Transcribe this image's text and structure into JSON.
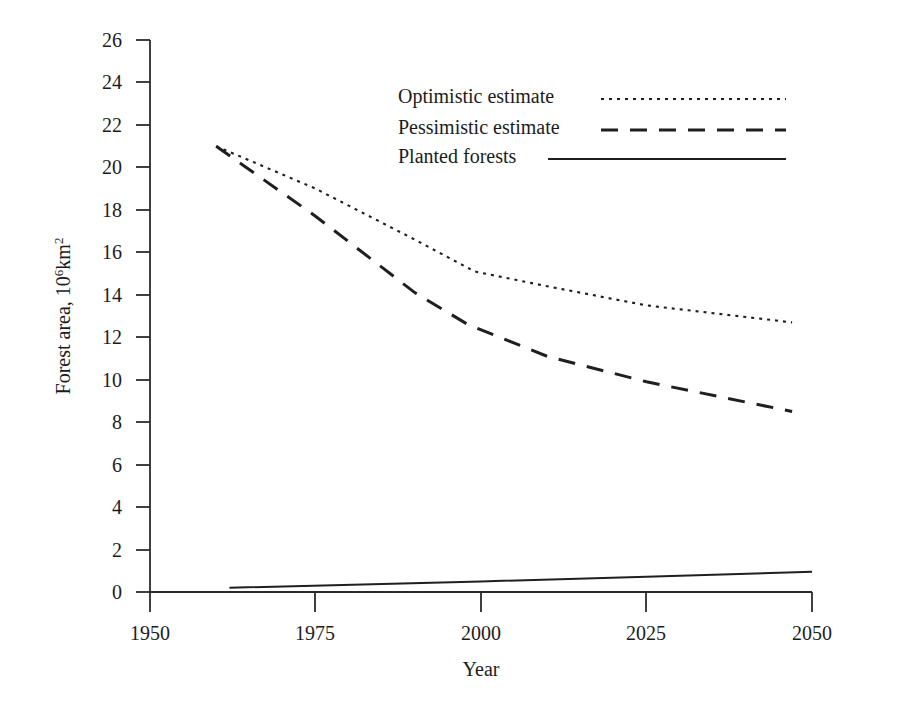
{
  "chart_data": {
    "type": "line",
    "title": "",
    "xlabel": "Year",
    "ylabel": "Forest area, 10⁶km²",
    "ylabel_base": "Forest area, 10",
    "ylabel_exp": "6",
    "ylabel_unit": "km",
    "ylabel_unit_exp": "2",
    "xlim": [
      1950,
      2050
    ],
    "ylim": [
      0,
      26
    ],
    "grid": false,
    "legend_position": "top-right",
    "x_ticks": [
      1950,
      1975,
      2000,
      2025,
      2050
    ],
    "x_tick_labels": [
      "1950",
      "1975",
      "2000",
      "2025",
      "2050"
    ],
    "y_ticks": [
      0,
      2,
      4,
      6,
      8,
      10,
      12,
      14,
      16,
      18,
      20,
      22,
      24,
      26
    ],
    "y_tick_labels": [
      "0",
      "2",
      "4",
      "6",
      "8",
      "10",
      "12",
      "14",
      "16",
      "18",
      "20",
      "22",
      "24",
      "26"
    ],
    "series": [
      {
        "name": "Optimistic estimate",
        "style": "dotted",
        "x": [
          1960,
          1975,
          1990,
          1999,
          2010,
          2025,
          2047
        ],
        "values": [
          21.0,
          19.0,
          16.6,
          15.1,
          14.4,
          13.5,
          12.7
        ]
      },
      {
        "name": "Pessimistic estimate",
        "style": "dashed",
        "x": [
          1960,
          1975,
          1990,
          1998,
          2010,
          2025,
          2047
        ],
        "values": [
          21.0,
          17.7,
          14.1,
          12.6,
          11.1,
          9.9,
          8.5
        ]
      },
      {
        "name": "Planted forests",
        "style": "solid",
        "x": [
          1962,
          2000,
          2025,
          2050
        ],
        "values": [
          0.2,
          0.5,
          0.72,
          0.95
        ]
      }
    ]
  },
  "legend": {
    "entries": [
      {
        "label": "Optimistic estimate",
        "style": "dotted"
      },
      {
        "label": "Pessimistic estimate",
        "style": "dashed"
      },
      {
        "label": "Planted forests",
        "style": "solid"
      }
    ]
  },
  "colors": {
    "ink": "#1f1f1f",
    "axis": "#2b2b2b",
    "background": "#ffffff"
  }
}
